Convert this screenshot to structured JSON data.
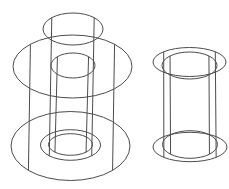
{
  "drawing": {
    "kind": "cad-wireframe-line-drawing",
    "canvas": {
      "width": 229,
      "height": 189,
      "background": "#ffffff"
    },
    "stroke": {
      "color": "#4c4c4c",
      "width": 1
    },
    "isoline_factor": 0.7071,
    "objects": [
      {
        "name": "left-cylinder-assembly",
        "cylinders": [
          {
            "name": "outer-flange-cylinder",
            "top": {
              "cx": 72.5,
              "cy": 66.5,
              "rx": 59.5,
              "ry": 31.5
            },
            "bottom": {
              "cx": 70.5,
              "cy": 146.0,
              "rx": 59.5,
              "ry": 34.5
            }
          },
          {
            "name": "middle-tall-cylinder",
            "top": {
              "cx": 73.0,
              "cy": 29.0,
              "rx": 30.0,
              "ry": 16.0
            },
            "bottom": {
              "cx": 70.5,
              "cy": 145.0,
              "rx": 30.0,
              "ry": 15.3
            }
          },
          {
            "name": "inner-bore-cylinder",
            "top": {
              "cx": 73.0,
              "cy": 65.5,
              "rx": 22.0,
              "ry": 12.5
            },
            "bottom": {
              "cx": 70.5,
              "cy": 144.5,
              "rx": 22.0,
              "ry": 10.8
            }
          }
        ]
      },
      {
        "name": "right-pipe-assembly",
        "cylinders": [
          {
            "name": "pipe-outer-wall-cylinder",
            "top": {
              "cx": 189.5,
              "cy": 62.0,
              "rx": 36.5,
              "ry": 14.5
            },
            "bottom": {
              "cx": 190.0,
              "cy": 147.0,
              "rx": 37.0,
              "ry": 14.7
            }
          },
          {
            "name": "pipe-inner-wall-cylinder",
            "top": {
              "cx": 189.5,
              "cy": 65.5,
              "rx": 27.5,
              "ry": 13.5
            },
            "bottom": {
              "cx": 190.0,
              "cy": 144.5,
              "rx": 27.5,
              "ry": 13.8
            }
          }
        ]
      }
    ]
  }
}
